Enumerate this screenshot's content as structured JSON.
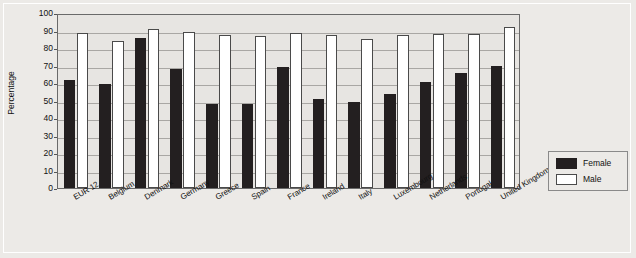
{
  "chart_data": {
    "type": "bar",
    "title": "",
    "xlabel": "",
    "ylabel": "Percentage",
    "ylim": [
      0,
      100
    ],
    "ytick_step": 10,
    "yticks": [
      100,
      90,
      80,
      70,
      60,
      50,
      40,
      30,
      20,
      10,
      0
    ],
    "grid": true,
    "legend_position": "outside-bottom-right",
    "categories": [
      "EUR 12",
      "Belgium",
      "Denmark",
      "Germany",
      "Greece",
      "Spain",
      "France",
      "Ireland",
      "Italy",
      "Luxembourg",
      "Netherlands",
      "Portugal",
      "United Kingdom"
    ],
    "series": [
      {
        "name": "Female",
        "color": "#231f20",
        "values": [
          62,
          59.5,
          85.5,
          68,
          48,
          48,
          69,
          51,
          49,
          54,
          60.5,
          65.5,
          70
        ]
      },
      {
        "name": "Male",
        "color": "#ffffff",
        "values": [
          88.5,
          84,
          91,
          89,
          87.5,
          87,
          88.5,
          87.5,
          85,
          87.5,
          88,
          88,
          92
        ]
      }
    ]
  },
  "legend": {
    "items": [
      {
        "label": "Female",
        "swatch": "female"
      },
      {
        "label": "Male",
        "swatch": "male"
      }
    ]
  }
}
